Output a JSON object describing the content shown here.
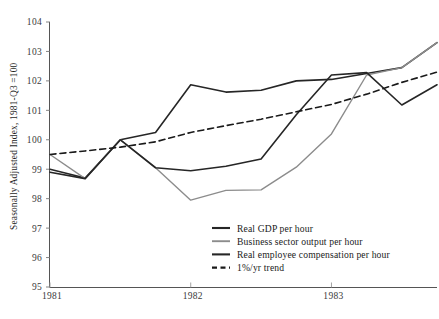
{
  "chart_data": {
    "type": "line",
    "title": "",
    "xlabel": "",
    "ylabel": "Seasonally Adjusted Index, 1981-Q3 =100",
    "ylim": [
      95,
      104
    ],
    "yticks": [
      95,
      96,
      97,
      98,
      99,
      100,
      101,
      102,
      103,
      104
    ],
    "ytick_labels": [
      "95",
      "96",
      "97",
      "98",
      "99",
      "100",
      "101",
      "102",
      "103",
      "104"
    ],
    "xlim": [
      1981.0,
      1983.75
    ],
    "xticks": [
      1981,
      1982,
      1983
    ],
    "xtick_labels": [
      "1981",
      "1982",
      "1983"
    ],
    "x": [
      1981.0,
      1981.25,
      1981.5,
      1981.75,
      1982.0,
      1982.25,
      1982.5,
      1982.75,
      1983.0,
      1983.25,
      1983.5,
      1983.75
    ],
    "x_quarter_labels": [
      "1981-Q1",
      "1981-Q2",
      "1981-Q3",
      "1981-Q4",
      "1982-Q1",
      "1982-Q2",
      "1982-Q3",
      "1982-Q4",
      "1983-Q1",
      "1983-Q2",
      "1983-Q3",
      "1983-Q4"
    ],
    "grid": false,
    "legend_position": "lower-center-right",
    "series": [
      {
        "name": "Real GDP per hour",
        "color": "#262626",
        "style": "solid",
        "width": 1.6,
        "values": [
          99.0,
          98.7,
          100.0,
          100.25,
          101.87,
          101.62,
          101.68,
          102.0,
          102.05,
          102.25,
          102.45,
          103.3
        ]
      },
      {
        "name": "Business sector output per hour",
        "color": "#8c8c8c",
        "style": "solid",
        "width": 1.4,
        "values": [
          99.5,
          98.68,
          100.0,
          99.05,
          97.95,
          98.28,
          98.3,
          99.07,
          100.2,
          102.2,
          102.45,
          103.3
        ]
      },
      {
        "name": "Real employee compensation per hour",
        "color": "#262626",
        "style": "solid",
        "width": 1.6,
        "values": [
          98.9,
          98.68,
          100.0,
          99.05,
          98.95,
          99.1,
          99.35,
          100.85,
          102.2,
          102.28,
          101.18,
          101.87
        ]
      },
      {
        "name": "1%/yr trend",
        "color": "#1a1a1a",
        "style": "dashed",
        "width": 1.6,
        "values": [
          99.5,
          99.62,
          99.75,
          99.93,
          100.25,
          100.48,
          100.7,
          100.95,
          101.2,
          101.55,
          101.95,
          102.3
        ]
      }
    ]
  },
  "legend": {
    "items": [
      {
        "label": "Real GDP per hour"
      },
      {
        "label": "Business sector output per hour"
      },
      {
        "label": "Real employee compensation per hour"
      },
      {
        "label": "1%/yr trend"
      }
    ]
  },
  "footer": {
    "partial_caption": ""
  }
}
